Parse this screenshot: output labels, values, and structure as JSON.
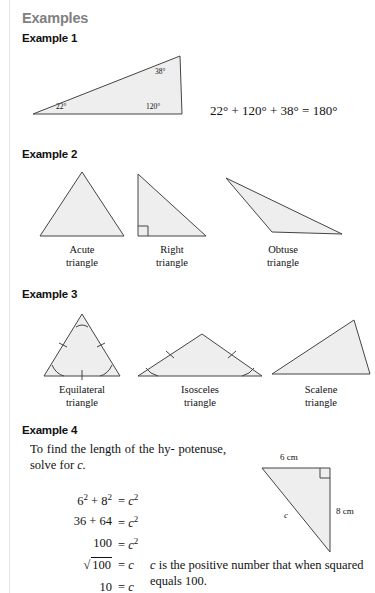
{
  "page": {
    "section_title": "Examples",
    "fill_color": "#eeeeee",
    "stroke_color": "#444444",
    "title_color": "#808080"
  },
  "example1": {
    "heading": "Example 1",
    "triangle": {
      "angles": [
        {
          "label": "22°",
          "vertex": "left"
        },
        {
          "label": "120°",
          "vertex": "bottom-right"
        },
        {
          "label": "38°",
          "vertex": "top-right"
        }
      ]
    },
    "equation": {
      "a": "22°",
      "plus1": "+",
      "b": "120°",
      "plus2": "+",
      "c": "38°",
      "equals": "=",
      "sum": "180°",
      "full": "22° + 120° + 38° = 180°"
    }
  },
  "example2": {
    "heading": "Example 2",
    "figures": [
      {
        "name": "acute",
        "label_line1": "Acute",
        "label_line2": "triangle"
      },
      {
        "name": "right",
        "label_line1": "Right",
        "label_line2": "triangle"
      },
      {
        "name": "obtuse",
        "label_line1": "Obtuse",
        "label_line2": "triangle"
      }
    ]
  },
  "example3": {
    "heading": "Example 3",
    "figures": [
      {
        "name": "equilateral",
        "label_line1": "Equilateral",
        "label_line2": "triangle"
      },
      {
        "name": "isosceles",
        "label_line1": "Isosceles",
        "label_line2": "triangle"
      },
      {
        "name": "scalene",
        "label_line1": "Scalene",
        "label_line2": "triangle"
      }
    ]
  },
  "example4": {
    "heading": "Example 4",
    "intro_line1": "To find the length of the hy-",
    "intro_line2": "potenuse, solve for ",
    "intro_var": "c.",
    "steps": [
      {
        "lhs_a": "6",
        "lhs_a_sup": "2",
        "op": "+",
        "lhs_b": "8",
        "lhs_b_sup": "2",
        "rhs": "c",
        "rhs_sup": "2"
      },
      {
        "lhs_a": "36",
        "op": "+",
        "lhs_b": "64",
        "rhs": "c",
        "rhs_sup": "2"
      },
      {
        "lhs_a": "100",
        "rhs": "c",
        "rhs_sup": "2"
      },
      {
        "lhs_a": "100",
        "radical": "√",
        "rhs": "c",
        "rhs_sup": ""
      },
      {
        "lhs_a": "10",
        "rhs": "c",
        "rhs_sup": ""
      }
    ],
    "equals_sign": "=",
    "note_line1_var": "c",
    "note_line1": " is the positive number that when",
    "note_line2": "squared equals 100.",
    "diagram": {
      "top_label": "6 cm",
      "right_label": "8 cm",
      "hyp_label": "c",
      "right_angle": "right-angle-marker"
    }
  }
}
